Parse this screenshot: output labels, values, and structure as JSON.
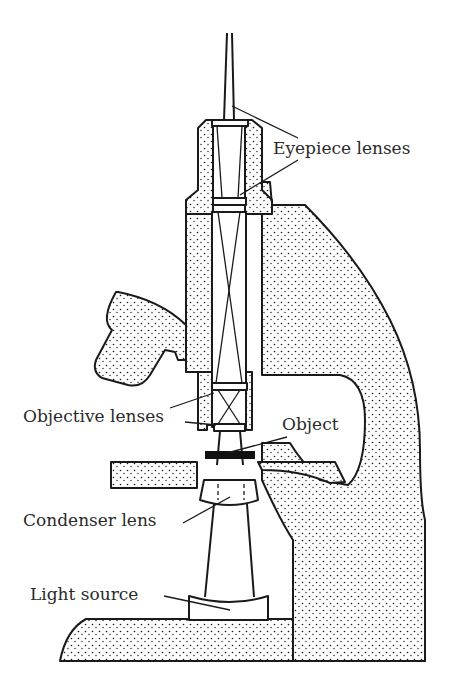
{
  "diagram": {
    "labels": {
      "eyepiece_lenses": "Eyepiece lenses",
      "objective_lenses": "Objective lenses",
      "object": "Object",
      "condenser_lens": "Condenser lens",
      "light_source": "Light source"
    },
    "colors": {
      "ink": "#1a1a1a",
      "text": "#2a2a2a",
      "background": "#ffffff"
    }
  }
}
